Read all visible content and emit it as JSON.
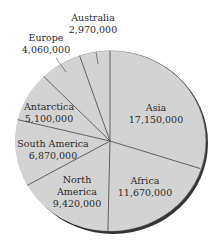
{
  "chart_data": {
    "type": "pie",
    "title": "",
    "unit": "square miles (area of continents)",
    "categories": [
      "Asia",
      "Africa",
      "North America",
      "South America",
      "Antarctica",
      "Europe",
      "Australia"
    ],
    "values": [
      17150000,
      11670000,
      9420000,
      6870000,
      5100000,
      4060000,
      2970000
    ],
    "value_labels": [
      "17,150,000",
      "11,670,000",
      "9,420,000",
      "6,870,000",
      "5,100,000",
      "4,060,000",
      "2,970,000"
    ],
    "start_angle_deg": -90,
    "direction": "clockwise",
    "legend": "none (inline labels)",
    "colors": {
      "slice_fill": "#d3d3d3",
      "divider": "#555555",
      "shadow": "#333333",
      "text": "#2a2a2a"
    }
  },
  "labels": {
    "asia": {
      "name": "Asia",
      "value": "17,150,000"
    },
    "africa": {
      "name": "Africa",
      "value": "11,670,000"
    },
    "north_america": {
      "name1": "North",
      "name2": "America",
      "value": "9,420,000"
    },
    "south_america": {
      "name": "South America",
      "value": "6,870,000"
    },
    "antarctica": {
      "name": "Antarctica",
      "value": "5,100,000"
    },
    "europe": {
      "name": "Europe",
      "value": "4,060,000"
    },
    "australia": {
      "name": "Australia",
      "value": "2,970,000"
    }
  }
}
